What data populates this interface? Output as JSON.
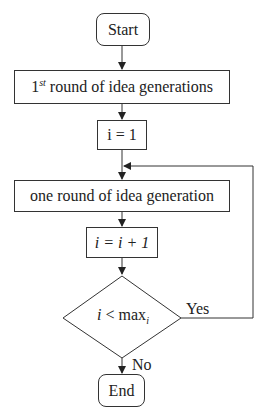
{
  "diagram": {
    "type": "flowchart",
    "nodes": {
      "start": {
        "label": "Start"
      },
      "first_round": {
        "prefix": "1",
        "sup": "st",
        "label": " round of idea generations"
      },
      "init": {
        "label": "i = 1"
      },
      "one_round": {
        "label": "one round of idea generation"
      },
      "increment": {
        "label": "i = i + 1"
      },
      "decision": {
        "var": "i",
        "op": " < max",
        "sub": "i"
      },
      "end": {
        "label": "End"
      }
    },
    "edges": {
      "yes_label": "Yes",
      "no_label": "No"
    },
    "colors": {
      "stroke": "#333333",
      "background": "#ffffff"
    }
  }
}
